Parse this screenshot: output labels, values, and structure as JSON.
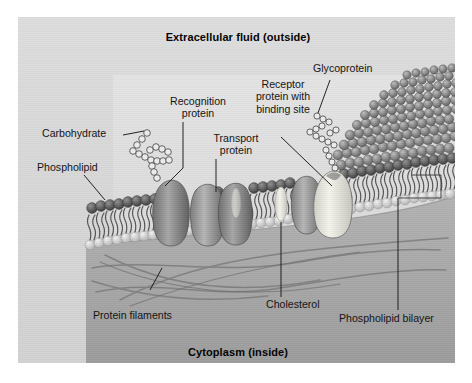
{
  "figure": {
    "kind": "cell-membrane-fluid-mosaic-diagram",
    "top_title": "Extracellular fluid (outside)",
    "bottom_title": "Cytoplasm (inside)"
  },
  "labels": {
    "carbohydrate": "Carbohydrate",
    "phospholipid": "Phospholipid",
    "recognition_protein_l1": "Recognition",
    "recognition_protein_l2": "protein",
    "transport_protein_l1": "Transport",
    "transport_protein_l2": "protein",
    "receptor_l1": "Receptor",
    "receptor_l2": "protein with",
    "receptor_l3": "binding site",
    "glycoprotein": "Glycoprotein",
    "protein_filaments": "Protein filaments",
    "cholesterol": "Cholesterol",
    "phospholipid_bilayer": "Phospholipid bilayer"
  },
  "colors": {
    "page_background": "#ffffff",
    "panel_background": "#d9d9d9",
    "extracellular_light": "#e4e4e4",
    "cytoplasm": "#a8a8a8",
    "membrane_head": "#6b6b6b",
    "membrane_head_dark": "#3c3c3c",
    "protein_body": "#8d8d8d",
    "cholesterol": "#e8e8e0",
    "leader_line": "#1a1a1a",
    "text": "#111111"
  }
}
